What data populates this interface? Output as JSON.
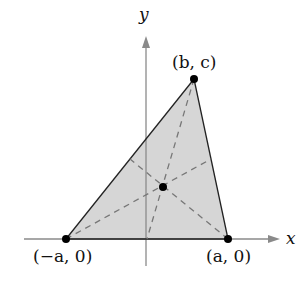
{
  "diagram": {
    "axes": {
      "x_label": "x",
      "y_label": "y"
    },
    "vertices": [
      {
        "id": "left",
        "label": "(−a, 0)",
        "px": [
          66,
          239
        ]
      },
      {
        "id": "right",
        "label": "(a, 0)",
        "px": [
          228,
          239
        ]
      },
      {
        "id": "top",
        "label": "(b, c)",
        "px": [
          194,
          79
        ]
      }
    ],
    "centroid": {
      "px": [
        163,
        187
      ]
    },
    "medians": [
      {
        "from": "top",
        "to_midpoint_px": [
          147,
          239
        ]
      },
      {
        "from": "left",
        "to_midpoint_px": [
          211,
          159
        ]
      },
      {
        "from": "right",
        "to_midpoint_px": [
          130,
          159
        ]
      }
    ],
    "colors": {
      "fill": "#d6d6d6",
      "edge": "#222222",
      "axis": "#888888",
      "median": "#777777",
      "point": "#000000"
    }
  }
}
